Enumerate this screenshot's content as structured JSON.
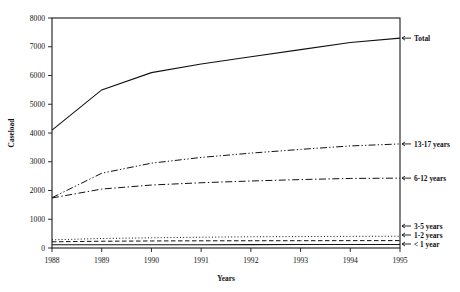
{
  "chart_data": {
    "type": "line",
    "title": "",
    "xlabel": "Years",
    "ylabel": "Caseload",
    "x": [
      1988,
      1989,
      1990,
      1991,
      1992,
      1993,
      1994,
      1995
    ],
    "categories": [
      "1988",
      "1989",
      "1990",
      "1991",
      "1992",
      "1993",
      "1994",
      "1995"
    ],
    "xlim": [
      1988,
      1995
    ],
    "ylim": [
      0,
      8000
    ],
    "ytick_values": [
      0,
      1000,
      2000,
      3000,
      4000,
      5000,
      6000,
      7000,
      8000
    ],
    "ytick_labels": [
      "0",
      "1000",
      "2000",
      "3000",
      "4000",
      "5000",
      "6000",
      "7000",
      "8000"
    ],
    "xtick_labels": [
      "1988",
      "1989",
      "1990",
      "1991",
      "1992",
      "1993",
      "1994",
      "1995"
    ],
    "grid": false,
    "legend_position": "right-inline-arrows",
    "series": [
      {
        "name": "Total",
        "style": "solid",
        "values": [
          4100,
          5500,
          6100,
          6400,
          6650,
          6900,
          7150,
          7300
        ]
      },
      {
        "name": "13-17 years",
        "style": "dash-dot-dot",
        "values": [
          1750,
          2600,
          2950,
          3150,
          3300,
          3430,
          3550,
          3620
        ]
      },
      {
        "name": "6-12 years",
        "style": "dash-dot",
        "values": [
          1740,
          2050,
          2190,
          2270,
          2330,
          2380,
          2420,
          2430
        ]
      },
      {
        "name": "3-5 years",
        "style": "dotted",
        "values": [
          285,
          330,
          355,
          375,
          390,
          398,
          405,
          410
        ]
      },
      {
        "name": "1-2 years",
        "style": "dashed",
        "values": [
          215,
          235,
          245,
          250,
          252,
          254,
          256,
          258
        ]
      },
      {
        "name": "< 1 year",
        "style": "solid",
        "values": [
          110,
          112,
          114,
          116,
          118,
          119,
          120,
          122
        ]
      }
    ],
    "legend_entries": [
      {
        "label": "Total",
        "arrow": "←"
      },
      {
        "label": "13-17 years",
        "arrow": "←"
      },
      {
        "label": "6-12 years",
        "arrow": "←"
      },
      {
        "label": "3-5 years",
        "arrow": "←"
      },
      {
        "label": "1-2 years",
        "arrow": "←"
      },
      {
        "label": "< 1 year",
        "arrow": "←"
      }
    ],
    "colors": {
      "ink": "#111111",
      "background": "#ffffff"
    }
  }
}
